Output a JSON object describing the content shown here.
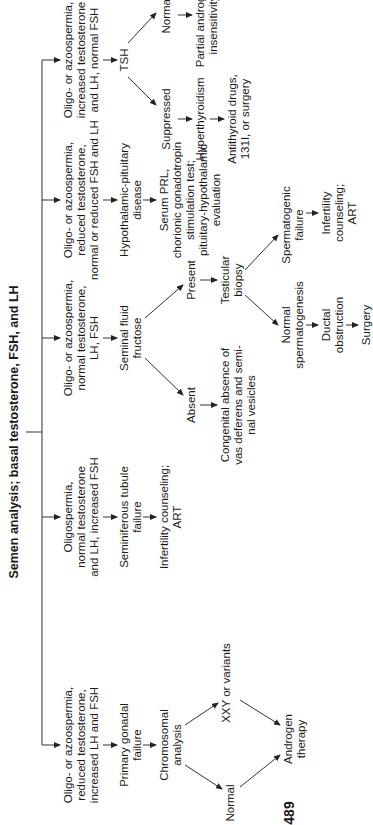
{
  "title": "Semen analysis;  basal testosterone, FSH, and LH",
  "page_number": "489",
  "columns": [
    {
      "finding": [
        "Oligo- or azoospermia,",
        "reduced testosterone,",
        "increased LH and FSH"
      ],
      "step1": [
        "Primary gonadal",
        "failure"
      ],
      "step2": [
        "Chromosomal",
        "analysis"
      ],
      "branch_left": "Normal",
      "branch_right": "XXY or variants",
      "outcome": [
        "Androgen",
        "therapy"
      ]
    },
    {
      "finding": [
        "Oligospermia,",
        "normal testosterone",
        "and LH, increased FSH"
      ],
      "step1": [
        "Seminiferous tubule",
        "failure"
      ],
      "step2": [
        "Infertility counseling;",
        "ART"
      ]
    },
    {
      "finding": [
        "Oligo- or azoospermia,",
        "normal testosterone,",
        "LH, FSH"
      ],
      "step1": [
        "Seminal fluid",
        "fructose"
      ],
      "branch_left": "Absent",
      "branch_left_outcome": [
        "Congenital absence of",
        "vas deferens and semi-",
        "nal vesicles"
      ],
      "branch_right": "Present",
      "branch_right_step": [
        "Testicular",
        "biopsy"
      ],
      "biopsy_left": [
        "Normal",
        "spermatogenesis"
      ],
      "biopsy_left_step": [
        "Ductal",
        "obstruction"
      ],
      "biopsy_left_outcome": "Surgery",
      "biopsy_right": [
        "Spermatogenic",
        "failure"
      ],
      "biopsy_right_outcome": [
        "Infertility",
        "counseling;",
        "ART"
      ]
    },
    {
      "finding": [
        "Oligo- or azoospermia,",
        "reduced testosterone,",
        "normal or reduced FSH and LH"
      ],
      "step1": [
        "Hypothalamic-pituitary",
        "disease"
      ],
      "step2": [
        "Serum PRL,",
        "chorionic gonadotropin",
        "stimulation test;",
        "pituitary-hypothalamic",
        "evaluation"
      ]
    },
    {
      "finding": [
        "Oligo- or azoospermia,",
        "increased testosterone",
        "and LH, normal FSH"
      ],
      "step1": "TSH",
      "branch_left": "Suppressed",
      "branch_left_step": "Hyperthyroidism",
      "branch_left_outcome": [
        "Antithyroid drugs,",
        "131I, or surgery"
      ],
      "branch_right": "Normal",
      "branch_right_outcome": [
        "Partial androgen",
        "insensitivity"
      ]
    }
  ]
}
